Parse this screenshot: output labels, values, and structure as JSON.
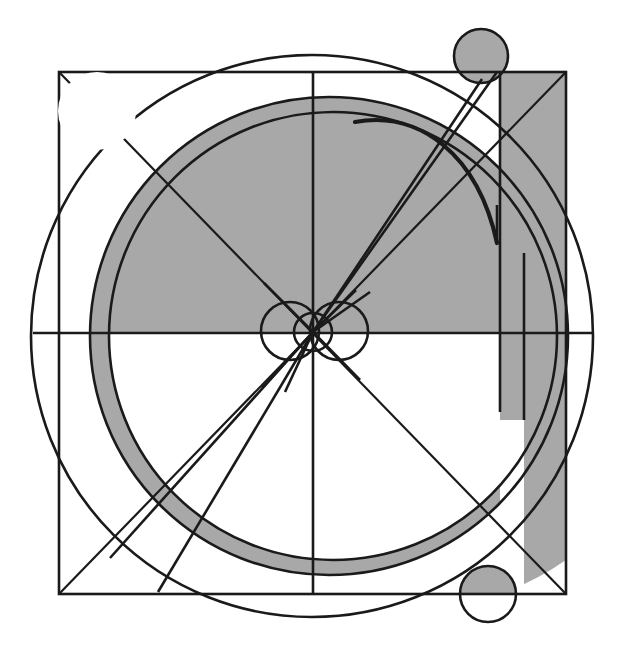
{
  "figure": {
    "canvas": {
      "width": 621,
      "height": 660,
      "background": "#ffffff"
    },
    "palette": {
      "ink": "#1a1a1a",
      "gray_fill": "#a8a8a8",
      "paper": "#ffffff"
    },
    "square": {
      "label": "bounding-square",
      "x": 59,
      "y": 72,
      "width": 507,
      "height": 522
    },
    "circles": {
      "outer": {
        "label": "outer-circle",
        "cx": 312,
        "cy": 336,
        "r": 281
      },
      "ring_outer": {
        "label": "ring-outer-circle",
        "cx": 329,
        "cy": 336,
        "r": 239
      },
      "ring_inner": {
        "label": "ring-inner-circle",
        "cx": 333,
        "cy": 336,
        "r": 224
      },
      "corner_top_left": {
        "label": "circle-top-left",
        "cx": 97,
        "cy": 111,
        "r": 39,
        "fill": "white"
      },
      "corner_top_right": {
        "label": "circle-top-right",
        "cx": 481,
        "cy": 56,
        "r": 27,
        "fill": "gray"
      },
      "corner_bottom_right": {
        "label": "circle-bottom-right",
        "cx": 488,
        "cy": 594,
        "r": 28,
        "fill": "split"
      },
      "hub_center": {
        "label": "hub-circle-center",
        "cx": 313,
        "cy": 332,
        "r": 19
      },
      "hub_left": {
        "label": "hub-circle-left",
        "cx": 290,
        "cy": 331,
        "r": 29
      },
      "hub_right": {
        "label": "hub-circle-right",
        "cx": 339,
        "cy": 331,
        "r": 29
      }
    },
    "axes": {
      "horizontal": {
        "label": "horizontal-axis",
        "y": 333,
        "x1": 33,
        "x2": 593
      },
      "vertical": {
        "label": "vertical-axis",
        "x": 313,
        "y1": 72,
        "y2": 594
      }
    },
    "verticals": [
      {
        "label": "vertical-segment-inner",
        "x": 500,
        "y1": 72,
        "y2": 412
      },
      {
        "label": "vertical-segment-outer",
        "x": 524,
        "y1": 253,
        "y2": 420
      }
    ],
    "rays": [
      {
        "label": "ray-upper-left",
        "x2": 116,
        "y2": 135
      },
      {
        "label": "ray-upper-right-a",
        "x2": 497,
        "y2": 72
      },
      {
        "label": "ray-upper-right-b",
        "x2": 482,
        "y2": 79
      },
      {
        "label": "ray-lower-left-a",
        "x2": 110,
        "y2": 558
      },
      {
        "label": "ray-lower-left-b",
        "x2": 158,
        "y2": 592
      },
      {
        "label": "ray-lower-right",
        "x2": 508,
        "y2": 594
      }
    ],
    "diagonals": [
      {
        "label": "diagonal-tl-br",
        "x1": 59,
        "y1": 72,
        "x2": 566,
        "y2": 594
      },
      {
        "label": "diagonal-tr-bl",
        "x1": 566,
        "y1": 72,
        "x2": 59,
        "y2": 594
      }
    ],
    "spiral_arc": {
      "label": "spiral-arc",
      "start": {
        "x": 355,
        "y": 122
      },
      "end": {
        "x": 497,
        "y": 243
      },
      "description": "thick curved arc from upper middle sweeping to the right"
    },
    "shading": {
      "description": "gray filled upper half-disc and lower annulus ring, plus a gray vertical strip at right",
      "upper_half_filled": true,
      "lower_ring_filled": true,
      "right_strip": {
        "x": 500,
        "y": 72,
        "width": 66,
        "height": 522
      }
    }
  }
}
